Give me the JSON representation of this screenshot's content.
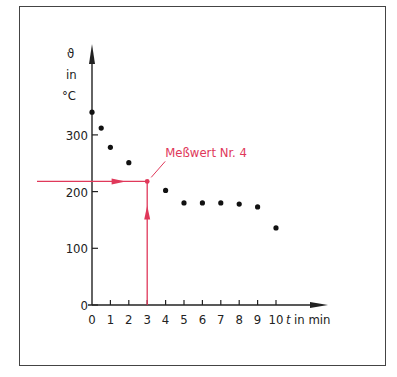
{
  "chart_data": {
    "type": "scatter",
    "title": "",
    "xlabel": "t in min",
    "ylabel_symbol": "ϑ",
    "ylabel_unit_in": "in",
    "ylabel_unit": "°C",
    "x_ticks": [
      "0",
      "1",
      "2",
      "3",
      "4",
      "5",
      "6",
      "7",
      "8",
      "9",
      "10"
    ],
    "y_ticks": [
      "0",
      "100",
      "200",
      "300"
    ],
    "xlim": [
      0,
      10.5
    ],
    "ylim": [
      0,
      380
    ],
    "grid": false,
    "points": [
      {
        "x": 0,
        "y": 340
      },
      {
        "x": 0.5,
        "y": 312
      },
      {
        "x": 1,
        "y": 278
      },
      {
        "x": 2,
        "y": 251
      },
      {
        "x": 3,
        "y": 218
      },
      {
        "x": 4,
        "y": 202
      },
      {
        "x": 5,
        "y": 180
      },
      {
        "x": 6,
        "y": 180
      },
      {
        "x": 7,
        "y": 180
      },
      {
        "x": 8,
        "y": 178
      },
      {
        "x": 9,
        "y": 173
      },
      {
        "x": 10,
        "y": 136
      }
    ],
    "annotation": {
      "text": "Meßwert Nr. 4",
      "x": 3,
      "y": 218,
      "color": "#e0385a"
    },
    "point_color": "#111111",
    "axis_color": "#222222"
  }
}
